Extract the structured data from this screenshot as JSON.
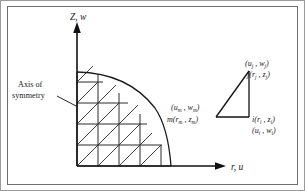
{
  "figure": {
    "kind": "axisymmetric-finite-element-mesh",
    "background_color": "#ffffff",
    "ink_color": "#1a1a1a",
    "frame": {
      "outer_color": "#9a9a9a",
      "inner_color": "#6e6e6e"
    }
  },
  "axes": {
    "vertical": {
      "label_main": "Z",
      "label_sep": ", ",
      "label_secondary": "w",
      "full_label": "Z, w",
      "arrow": "up-arrow-head"
    },
    "horizontal": {
      "label_main": "r",
      "label_sep": ", ",
      "label_secondary": "u",
      "full_label": "r, u",
      "arrow": "right-arrow-head"
    },
    "origin": {
      "x": 77,
      "y": 166
    }
  },
  "annotations": {
    "axis_of_symmetry": {
      "line1": "Axis of",
      "line2": "symmetry",
      "leader": "leader-line-to-axis"
    }
  },
  "mesh": {
    "description": "Quarter-circle domain discretized into right triangles",
    "columns": 4,
    "rows": 4,
    "cell_size": 21,
    "radius": 94
  },
  "element_detail": {
    "node_j": {
      "displacement": {
        "open": "(",
        "u": "u",
        "u_sub": "j",
        "comma": " , ",
        "w": "w",
        "w_sub": "j",
        "close": ")"
      },
      "coordinate": {
        "name": "j",
        "open": "(",
        "r": "r",
        "r_sub": "j",
        "comma": " , ",
        "z": "z",
        "z_sub": "j",
        "close": ")"
      }
    },
    "node_i": {
      "coordinate": {
        "name": "i",
        "open": "(",
        "r": "r",
        "r_sub": "i",
        "comma": " , ",
        "z": "z",
        "z_sub": "i",
        "close": ")"
      },
      "displacement": {
        "open": "(",
        "u": "u",
        "u_sub": "i",
        "comma": " , ",
        "w": "w",
        "w_sub": "i",
        "close": ")"
      }
    },
    "node_m": {
      "displacement": {
        "open": "(",
        "u": "u",
        "u_sub": "m",
        "comma": " , ",
        "w": "w",
        "w_sub": "m",
        "close": ")"
      },
      "coordinate": {
        "name": "m",
        "open": "(",
        "r": "r",
        "r_sub": "m",
        "comma": " , ",
        "z": "z",
        "z_sub": "m",
        "close": ")"
      }
    }
  }
}
